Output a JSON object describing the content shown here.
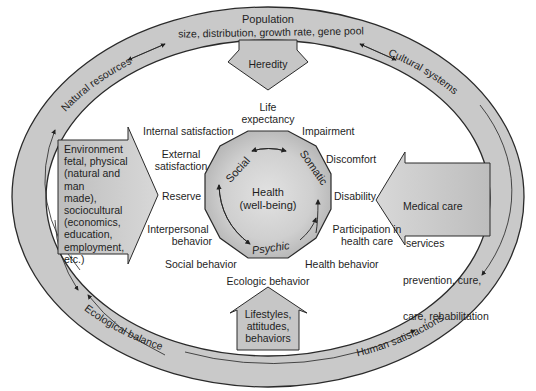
{
  "diagram": {
    "type": "health-ecology-model",
    "colors": {
      "ring_fill": "#c8c8c8",
      "ring_stroke": "#2a2a2a",
      "arrow_fill": "#c4c4c4",
      "core_fill": "#b8b8b8",
      "core_center": "#dcdcdc",
      "text": "#1e1e1e",
      "background": "#ffffff"
    },
    "outer_ring": {
      "top_title": "Population",
      "top_subtitle": "size, distribution, growth rate, gene pool",
      "upper_left": "Natural resources",
      "upper_right": "Cultural systems",
      "lower_left": "Ecological balance",
      "lower_right": "Human satisfactions"
    },
    "influences": {
      "top": "Heredity",
      "left": [
        "Environment",
        "fetal, physical",
        "(natural and man",
        "made),",
        "sociocultural",
        "(economics,",
        "education,",
        "employment,",
        "etc.)"
      ],
      "right": [
        "Medical care",
        " services",
        "prevention, cure,",
        "care, rehabilitation"
      ],
      "bottom": [
        "Lifestyles,",
        "attitudes,",
        "behaviors"
      ]
    },
    "core": {
      "title": "Health",
      "subtitle": "(well-being)",
      "dimensions": [
        "Social",
        "Somatic",
        "Psychic"
      ]
    },
    "outcomes": {
      "life_expectancy": [
        "Life",
        "expectancy"
      ],
      "impairment": "Impairment",
      "discomfort": "Discomfort",
      "disability": "Disability",
      "participation": [
        "Participation in",
        "health care"
      ],
      "health_behavior": "Health behavior",
      "ecologic_behavior": "Ecologic behavior",
      "social_behavior": "Social behavior",
      "interpersonal": [
        "Interpersonal",
        "behavior"
      ],
      "reserve": "Reserve",
      "external_satisfaction": [
        "External",
        "satisfaction"
      ],
      "internal_satisfaction": "Internal satisfaction"
    }
  }
}
